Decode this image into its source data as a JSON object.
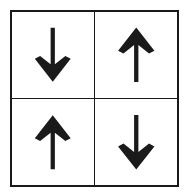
{
  "figure": {
    "title": "",
    "type": "arrow-grid-diagram",
    "background_color": "#ffffff",
    "stroke_color": "#1a1a1a",
    "outer_border_width_px": 2.5,
    "inner_divider_width_px": 1.5,
    "rows": 2,
    "columns": 2
  },
  "grid": {
    "cells": [
      {
        "position": "top-left",
        "row": 0,
        "column": 0,
        "icon": "arrow-left-icon",
        "direction": "left",
        "rotation_deg": 180,
        "label": ""
      },
      {
        "position": "top-right",
        "row": 0,
        "column": 1,
        "icon": "arrow-up-icon",
        "direction": "up",
        "rotation_deg": 0,
        "label": ""
      },
      {
        "position": "bottom-left",
        "row": 1,
        "column": 0,
        "icon": "arrow-up-icon",
        "direction": "up",
        "rotation_deg": 0,
        "label": ""
      },
      {
        "position": "bottom-right",
        "row": 1,
        "column": 1,
        "icon": "arrow-down-icon",
        "direction": "down",
        "rotation_deg": 180,
        "label": ""
      }
    ]
  }
}
